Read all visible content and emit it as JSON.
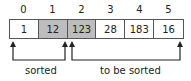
{
  "indices": [
    "0",
    "1",
    "2",
    "3",
    "4",
    "5"
  ],
  "values": [
    "1",
    "12",
    "123",
    "28",
    "183",
    "16"
  ],
  "highlighted": [
    1,
    2
  ],
  "labels": {
    "sorted": "sorted",
    "to_be_sorted": "to be sorted"
  },
  "colors": {
    "highlight": "#bdbdbd",
    "border": "#555555"
  }
}
